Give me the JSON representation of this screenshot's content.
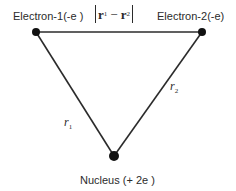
{
  "diagram": {
    "type": "helium-atom-electron-geometry",
    "nodes": {
      "electron1": {
        "label": "Electron-1(-e )",
        "x": 36,
        "y": 32
      },
      "electron2": {
        "label": "Electron-2(-e)",
        "x": 202,
        "y": 32
      },
      "nucleus": {
        "label": "Nucleus (+ 2e )",
        "x": 114,
        "y": 156
      }
    },
    "edges": {
      "electron_separation": {
        "from": "electron1",
        "to": "electron2",
        "label_var1": "r",
        "label_sub1": "1",
        "label_minus": "−",
        "label_var2": "r",
        "label_sub2": "2"
      },
      "r1": {
        "from": "electron1",
        "to": "nucleus",
        "label_var": "r",
        "label_sub": "1"
      },
      "r2": {
        "from": "electron2",
        "to": "nucleus",
        "label_var": "r",
        "label_sub": "2"
      }
    },
    "colors": {
      "line": "#2b2b2b",
      "dot": "#111111",
      "text": "#2b2b2b",
      "background": "#ffffff"
    }
  }
}
